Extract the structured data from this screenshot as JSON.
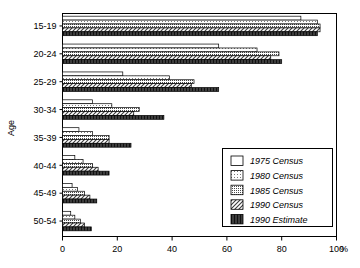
{
  "chart_data": {
    "type": "bar",
    "orientation": "horizontal",
    "title": "",
    "xlabel": "%",
    "ylabel": "Age",
    "xlim": [
      0,
      100
    ],
    "xticks": [
      0,
      20,
      40,
      60,
      80,
      100
    ],
    "xtick_labels": [
      "0",
      "20",
      "40",
      "60",
      "80",
      "100"
    ],
    "grid": false,
    "legend_position": "inside-lower-right",
    "categories": [
      "15-19",
      "20-24",
      "25-29",
      "30-34",
      "35-39",
      "40-44",
      "45-49",
      "50-54"
    ],
    "series": [
      {
        "name": "1975 Census",
        "pattern": "blank",
        "color": "#ffffff",
        "values": [
          87,
          57,
          22,
          11,
          6,
          4.5,
          3.5,
          3
        ]
      },
      {
        "name": "1980 Census",
        "pattern": "fine-dots",
        "color": "#e8e8e8",
        "values": [
          93,
          71,
          39,
          18,
          11,
          7.5,
          5.5,
          4.5
        ]
      },
      {
        "name": "1985 Census",
        "pattern": "coarse-dots",
        "color": "#c8c8c8",
        "values": [
          94,
          79,
          48,
          28,
          17,
          11,
          8,
          6.5
        ]
      },
      {
        "name": "1990 Census",
        "pattern": "diagonal",
        "color": "#b4b4b4",
        "values": [
          94,
          76,
          47,
          26,
          17,
          13,
          10,
          8
        ]
      },
      {
        "name": "1990 Estimate",
        "pattern": "vertical",
        "color": "#555555",
        "values": [
          93,
          80,
          57,
          37,
          25,
          17,
          12.5,
          10.5
        ]
      }
    ]
  },
  "legend": {
    "items": [
      {
        "label": "1975 Census"
      },
      {
        "label": "1980 Census"
      },
      {
        "label": "1985 Census"
      },
      {
        "label": "1990 Census"
      },
      {
        "label": "1990 Estimate"
      }
    ]
  },
  "axes": {
    "y_axis_title": "Age",
    "x_axis_unit": "%"
  }
}
